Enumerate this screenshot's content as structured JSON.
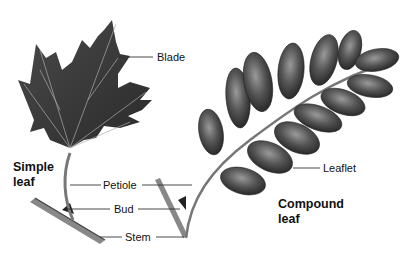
{
  "diagram": {
    "simple_leaf": {
      "title_line1": "Simple",
      "title_line2": "leaf"
    },
    "compound_leaf": {
      "title_line1": "Compound",
      "title_line2": "leaf"
    },
    "labels": {
      "blade": "Blade",
      "petiole": "Petiole",
      "bud": "Bud",
      "stem": "Stem",
      "leaflet": "Leaflet"
    },
    "colors": {
      "leaf_dark": "#3a3a3a",
      "leaf_mid": "#6a6a6a",
      "vein": "#b8b8b8",
      "line": "#333333"
    }
  }
}
